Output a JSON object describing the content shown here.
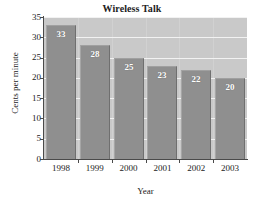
{
  "chart_data": {
    "type": "bar",
    "title": "Wireless Talk",
    "xlabel": "Year",
    "ylabel": "Cents per minute",
    "categories": [
      "1998",
      "1999",
      "2000",
      "2001",
      "2002",
      "2003"
    ],
    "values": [
      33,
      28,
      25,
      23,
      22,
      20
    ],
    "data_labels": [
      "33",
      "28",
      "25",
      "23",
      "22",
      "20"
    ],
    "ylim": [
      0,
      35
    ],
    "ytick_labels": [
      "0",
      "5",
      "10",
      "15",
      "20",
      "25",
      "30",
      "35"
    ],
    "ytick_values": [
      0,
      5,
      10,
      15,
      20,
      25,
      30,
      35
    ],
    "grid": "horizontal",
    "legend": null,
    "colors": {
      "bar_fill": "#8f8f8f",
      "panel_background": "#c9c9c9",
      "gridline": "#f2f2f2",
      "axis": "#4a4a4a",
      "text": "#1c1c1c",
      "data_label": "#ffffff",
      "figure_background": "#ffffff"
    }
  }
}
